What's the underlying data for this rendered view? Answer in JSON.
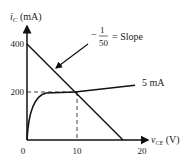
{
  "chart_data": {
    "type": "line",
    "title": "",
    "ylabel": "i_C (mA)",
    "ylabel_main": "i",
    "ylabel_sub": "C",
    "ylabel_unit": " (mA)",
    "xlabel": "v_CE (V)",
    "xlabel_main": "v",
    "xlabel_sub": "CE",
    "xlabel_unit": " (V)",
    "xlim": [
      0,
      20
    ],
    "ylim": [
      0,
      400
    ],
    "x_ticks": [
      {
        "value": 0,
        "label": "0"
      },
      {
        "value": 10,
        "label": "10"
      },
      {
        "value": 20,
        "label": "20"
      }
    ],
    "y_ticks": [
      {
        "value": 400,
        "label": "400"
      },
      {
        "value": 200,
        "label": "200"
      }
    ],
    "series": [
      {
        "name": "Load line",
        "points": [
          [
            0,
            400
          ],
          [
            20,
            0
          ]
        ],
        "annotation": "-1/50 = Slope"
      },
      {
        "name": "5 mA",
        "points": [
          [
            0,
            0
          ],
          [
            0.5,
            90
          ],
          [
            1.5,
            160
          ],
          [
            3,
            190
          ],
          [
            4,
            197
          ],
          [
            10,
            200
          ],
          [
            20,
            220
          ]
        ],
        "annotation": "5 mA"
      }
    ],
    "operating_point": {
      "x": 10,
      "y": 200
    },
    "slope_annotation": {
      "minus": "−",
      "numerator": "1",
      "denominator": "50",
      "text": "= Slope"
    },
    "curve_label": "5 mA"
  }
}
